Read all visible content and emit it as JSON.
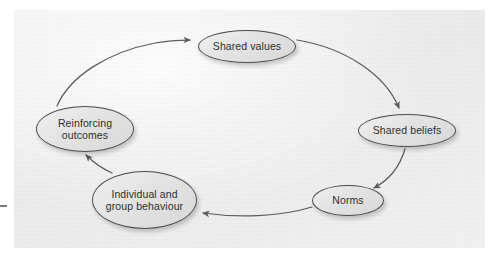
{
  "figure": {
    "kind": "cycle-diagram",
    "background_color": "#ffffff",
    "panel_color": "#eeeeee",
    "node_fill": "#e4e4e4",
    "node_stroke": "#4b4b4b",
    "text_color": "#2f2f2f",
    "arrow_color": "#5b5b5b"
  },
  "nodes": [
    {
      "id": "shared-values",
      "label": "Shared values",
      "lines": [
        "Shared values"
      ]
    },
    {
      "id": "shared-beliefs",
      "label": "Shared beliefs",
      "lines": [
        "Shared beliefs"
      ]
    },
    {
      "id": "norms",
      "label": "Norms",
      "lines": [
        "Norms"
      ]
    },
    {
      "id": "behaviour",
      "label": "Individual and group behaviour",
      "lines": [
        "Individual and",
        "group behaviour"
      ]
    },
    {
      "id": "reinforcing",
      "label": "Reinforcing outcomes",
      "lines": [
        "Reinforcing",
        "outcomes"
      ]
    }
  ],
  "edges": [
    {
      "from": "shared-values",
      "to": "shared-beliefs",
      "direction": "clockwise"
    },
    {
      "from": "shared-beliefs",
      "to": "norms",
      "direction": "clockwise"
    },
    {
      "from": "norms",
      "to": "behaviour",
      "direction": "clockwise"
    },
    {
      "from": "behaviour",
      "to": "reinforcing",
      "direction": "clockwise"
    },
    {
      "from": "reinforcing",
      "to": "shared-values",
      "direction": "clockwise"
    }
  ]
}
